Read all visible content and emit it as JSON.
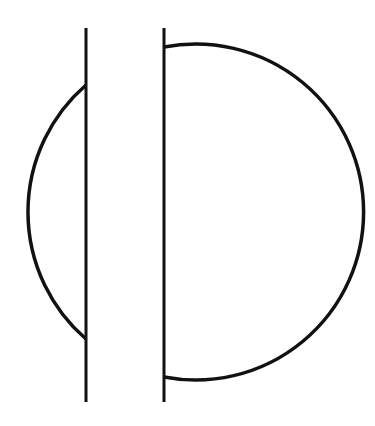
{
  "diagram": {
    "stroke_color": "#111111",
    "background": "#ffffff",
    "circle": {
      "cx": 196,
      "cy": 212,
      "r": 168
    },
    "lines": [
      {
        "x": 86,
        "y1": 28,
        "y2": 402
      },
      {
        "x": 164,
        "y1": 28,
        "y2": 402
      }
    ]
  }
}
